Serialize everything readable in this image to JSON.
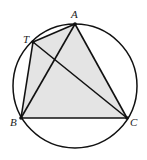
{
  "figure": {
    "type": "geometry",
    "circle": {
      "cx": 75,
      "cy": 86,
      "r": 62
    },
    "points": {
      "A": {
        "label": "A",
        "x": 75,
        "y": 24
      },
      "T": {
        "label": "T",
        "x": 33,
        "y": 42
      },
      "B": {
        "label": "B",
        "x": 21,
        "y": 118
      },
      "C": {
        "label": "C",
        "x": 127,
        "y": 118
      }
    },
    "segments": [
      "TA",
      "AC",
      "CB",
      "BT",
      "AB",
      "TC"
    ],
    "shaded_polygon": [
      "T",
      "A",
      "C",
      "B"
    ],
    "colors": {
      "stroke": "#111111",
      "fill": "#e4e4e4"
    }
  }
}
